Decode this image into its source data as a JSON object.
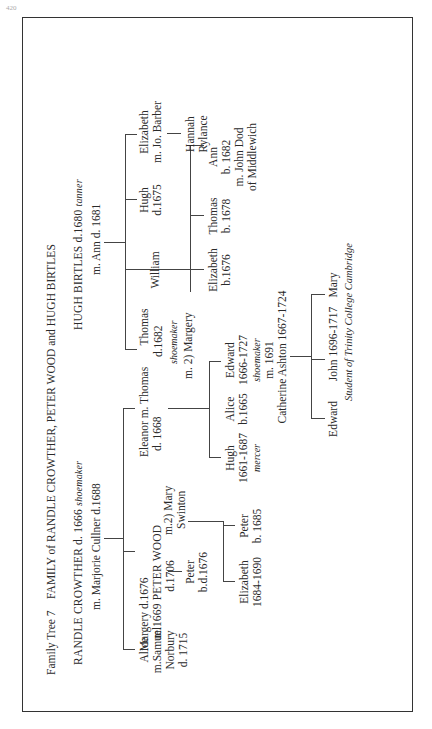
{
  "page_number": "420",
  "title": {
    "label": "Family Tree 7",
    "text": "FAMILY of RANDLE CROWTHER, PETER WOOD and HUGH BIRTLES"
  },
  "crowther": {
    "head": "RANDLE CROWTHER d. 1666",
    "head_occupation": "shoemaker",
    "spouse": "m. Marjorie Cullner d.1688",
    "children": [
      {
        "lines": [
          "Alice",
          "m.Samuel",
          "Norbury",
          "d. 1715"
        ]
      },
      {
        "lines": [
          "Margery d.1676",
          "m.1669 PETER WOOD",
          "d.1706"
        ]
      },
      {
        "lines": [
          "Eleanor m. Thomas",
          "d. 1668"
        ]
      }
    ]
  },
  "wood": {
    "second_marriage": [
      "m.2) Mary",
      "Swinton"
    ],
    "child_first": [
      "Peter",
      "b.d.1676"
    ],
    "children_second": [
      {
        "lines": [
          "Elizabeth",
          "1684-1690"
        ]
      },
      {
        "lines": [
          "Peter",
          "b. 1685"
        ]
      }
    ]
  },
  "thomas": {
    "lines": [
      "d.1682"
    ],
    "occupation": "shoemaker",
    "second_marriage": "m. 2) Margery",
    "children_first": [
      {
        "lines": [
          "Hugh",
          "1661-1687"
        ],
        "occupation": "mercer"
      },
      {
        "lines": [
          "Alice",
          "b.1665"
        ]
      },
      {
        "lines": [
          "Edward",
          "1666-1727"
        ],
        "occupation": "shoemaker",
        "marriage": [
          "m. 1691",
          "Catherine Ashton 1667-1724"
        ]
      }
    ],
    "children_second": [
      {
        "lines": [
          "Elizabeth",
          "b.1676"
        ]
      },
      {
        "lines": [
          "Thomas",
          "b. 1678"
        ]
      },
      {
        "lines": [
          "Ann",
          "b. 1682",
          "m. John Dod",
          "of Middlewich"
        ]
      }
    ]
  },
  "edward_children": [
    {
      "lines": [
        "Edward"
      ]
    },
    {
      "lines": [
        "John  1696-1717"
      ],
      "note": "Student of Trinity College Cambridge"
    },
    {
      "lines": [
        "Mary"
      ]
    }
  ],
  "birtles": {
    "head": "HUGH BIRTLES d.1680",
    "head_occupation": "tanner",
    "spouse": "m. Ann d. 1681",
    "children": [
      {
        "lines": [
          "Thomas"
        ]
      },
      {
        "lines": [
          "William"
        ]
      },
      {
        "lines": [
          "Hugh",
          "d.1675"
        ]
      },
      {
        "lines": [
          "Elizabeth",
          "m. Jo. Barber"
        ]
      }
    ],
    "grandchild": [
      "Hannah",
      "Rylance"
    ]
  }
}
